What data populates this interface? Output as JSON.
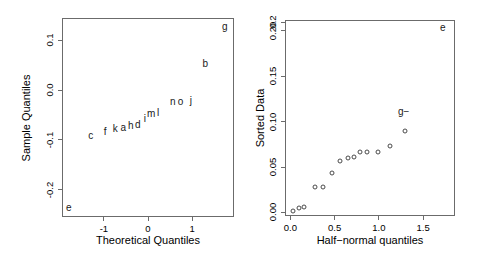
{
  "figure": {
    "background": "#ffffff",
    "axis_color": "#6b6b6b",
    "point_color": "#4a4a4a"
  },
  "chart_data": [
    {
      "type": "scatter",
      "panel": "left",
      "title": "",
      "xlabel": "Theoretical Quantiles",
      "ylabel": "Sample Quantiles",
      "xlim": [
        -1.95,
        1.95
      ],
      "ylim": [
        -0.255,
        0.145
      ],
      "xticks": [
        -1,
        0,
        1
      ],
      "xticklabels": [
        "-1",
        "0",
        "1"
      ],
      "yticks": [
        0.1,
        0.0,
        -0.1,
        -0.2
      ],
      "yticklabels": [
        "0.1",
        "0.0",
        "-0.1",
        "-0.2"
      ],
      "grid": false,
      "legend": "none",
      "marker": "text-label",
      "points": [
        {
          "label": "c",
          "x": -1.3,
          "y": -0.092
        },
        {
          "label": "f",
          "x": -0.97,
          "y": -0.085
        },
        {
          "label": "k",
          "x": -0.74,
          "y": -0.078
        },
        {
          "label": "a",
          "x": -0.56,
          "y": -0.076
        },
        {
          "label": "h",
          "x": -0.39,
          "y": -0.073
        },
        {
          "label": "d",
          "x": -0.23,
          "y": -0.07
        },
        {
          "label": "i",
          "x": -0.07,
          "y": -0.059
        },
        {
          "label": "m",
          "x": 0.07,
          "y": -0.047
        },
        {
          "label": "l",
          "x": 0.23,
          "y": -0.045
        },
        {
          "label": "n",
          "x": 0.56,
          "y": -0.024
        },
        {
          "label": "o",
          "x": 0.74,
          "y": -0.024
        },
        {
          "label": "j",
          "x": 0.97,
          "y": -0.021
        },
        {
          "label": "b",
          "x": 1.3,
          "y": 0.053
        }
      ],
      "annotations": [
        {
          "label": "g",
          "position": "top-right"
        },
        {
          "label": "e",
          "position": "bottom-left"
        }
      ]
    },
    {
      "type": "scatter",
      "panel": "right",
      "title": "",
      "xlabel": "Half−normal quantiles",
      "ylabel": "Sorted Data",
      "xlim": [
        -0.06,
        1.86
      ],
      "ylim": [
        -0.004,
        0.212
      ],
      "xticks": [
        0.0,
        0.5,
        1.0,
        1.5
      ],
      "xticklabels": [
        "0.0",
        "0.5",
        "1.0",
        "1.5"
      ],
      "yticks": [
        0.0,
        0.05,
        0.1,
        0.15,
        0.2,
        0.2
      ],
      "yticklabels": [
        "0.00",
        "0.05",
        "0.10",
        "0.15",
        "0.20",
        "0.2"
      ],
      "grid": false,
      "legend": "none",
      "marker": "open-circle",
      "points": [
        {
          "x": 0.03,
          "y": 0.002
        },
        {
          "x": 0.1,
          "y": 0.005
        },
        {
          "x": 0.16,
          "y": 0.006
        },
        {
          "x": 0.28,
          "y": 0.028
        },
        {
          "x": 0.37,
          "y": 0.028
        },
        {
          "x": 0.47,
          "y": 0.043
        },
        {
          "x": 0.56,
          "y": 0.057
        },
        {
          "x": 0.65,
          "y": 0.06
        },
        {
          "x": 0.72,
          "y": 0.061
        },
        {
          "x": 0.79,
          "y": 0.066
        },
        {
          "x": 0.87,
          "y": 0.067
        },
        {
          "x": 0.99,
          "y": 0.067
        },
        {
          "x": 1.13,
          "y": 0.073
        },
        {
          "x": 1.3,
          "y": 0.09
        }
      ],
      "annotations": [
        {
          "label": "e",
          "position": "top-right"
        },
        {
          "label": "g−",
          "position": "mid-right"
        }
      ]
    }
  ]
}
